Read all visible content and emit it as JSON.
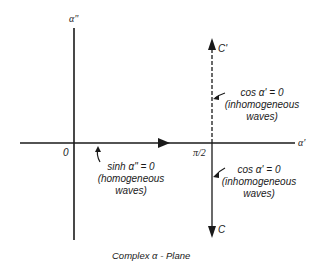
{
  "axes": {
    "vertical_label": "α\"",
    "horizontal_label": "α'",
    "origin_label": "0",
    "pi_half_label": "π/2"
  },
  "paths": {
    "upper_label": "C'",
    "lower_label": "C"
  },
  "annotations": {
    "homogeneous": {
      "equation": "sinh α\" = 0",
      "line2": "(homogeneous",
      "line3": "waves)"
    },
    "inhomogeneous_upper": {
      "equation": "cos α' = 0",
      "line2": "(inhomogeneous",
      "line3": "waves)"
    },
    "inhomogeneous_lower": {
      "equation": "cos α' = 0",
      "line2": "(inhomogeneous",
      "line3": "waves)"
    }
  },
  "caption": "Complex α - Plane",
  "colors": {
    "ink": "#1a1a1a",
    "background": "#ffffff"
  }
}
